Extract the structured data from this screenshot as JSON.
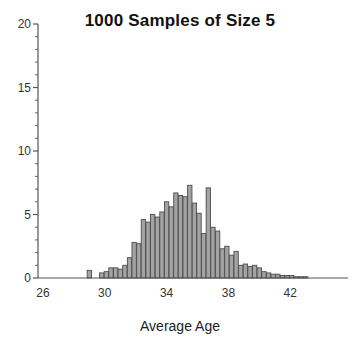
{
  "chart_data": {
    "type": "bar",
    "title": "1000 Samples of Size 5",
    "xlabel": "Average Age",
    "ylabel": "",
    "xlim": [
      25.0,
      44.0
    ],
    "ylim": [
      0,
      20
    ],
    "grid": false,
    "legend": null,
    "bar_fill_color": "#a3a3a3",
    "bar_edge_color": "#4d4d4d",
    "axis_color": "#555555",
    "bin_width": 0.28,
    "x_ticks": [
      26,
      30,
      34,
      38,
      42
    ],
    "x_tick_labels": [
      "26",
      "30",
      "34",
      "38",
      "42"
    ],
    "y_ticks": [
      0,
      5,
      10,
      15,
      20
    ],
    "y_tick_labels": [
      "0",
      "5",
      "10",
      "15",
      "20"
    ],
    "y_minor_tick_step": 1,
    "x": [
      29.0,
      29.5,
      29.8,
      30.1,
      30.4,
      30.7,
      31.0,
      31.3,
      31.6,
      31.9,
      32.2,
      32.5,
      32.8,
      33.1,
      33.4,
      33.7,
      34.0,
      34.3,
      34.6,
      34.9,
      35.2,
      35.5,
      35.8,
      36.1,
      36.4,
      36.7,
      37.0,
      37.3,
      37.6,
      37.9,
      38.2,
      38.5,
      38.8,
      39.1,
      39.4,
      39.7,
      40.0,
      40.3,
      40.6,
      40.9,
      41.2,
      41.5,
      41.8,
      42.1,
      42.4,
      42.7,
      43.0
    ],
    "values": [
      0.6,
      0.0,
      0.4,
      0.5,
      0.8,
      0.8,
      0.7,
      1.0,
      1.6,
      2.8,
      2.7,
      4.6,
      4.4,
      5.0,
      4.8,
      5.2,
      6.0,
      5.6,
      6.7,
      6.5,
      6.4,
      7.3,
      5.9,
      5.1,
      3.5,
      7.1,
      4.0,
      3.7,
      2.3,
      2.5,
      1.8,
      2.1,
      1.0,
      1.1,
      0.9,
      1.0,
      0.8,
      0.5,
      0.4,
      0.3,
      0.3,
      0.2,
      0.2,
      0.2,
      0.1,
      0.1,
      0.1
    ]
  },
  "axes": {
    "x_axis_name": "average-age-axis",
    "y_axis_name": "frequency-axis"
  }
}
